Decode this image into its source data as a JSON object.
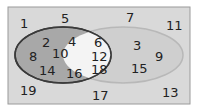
{
  "diagram": {
    "type": "venn",
    "colors": {
      "universe_fill": "#d9d9d9",
      "universe_border": "#9a9a9a",
      "set_a_fill": "#a8a8a8",
      "set_a_border": "#3a3a3a",
      "set_b_fill": "#cfcfcf",
      "set_b_border": "#b8b8b8",
      "intersection_fill": "#f4f4f4"
    },
    "outside": [
      "1",
      "5",
      "7",
      "11",
      "19",
      "17",
      "13"
    ],
    "set_a_only": [
      "2",
      "4",
      "8",
      "10",
      "14",
      "16"
    ],
    "intersection": [
      "6",
      "12",
      "18"
    ],
    "set_b_only": [
      "3",
      "9",
      "15"
    ]
  }
}
